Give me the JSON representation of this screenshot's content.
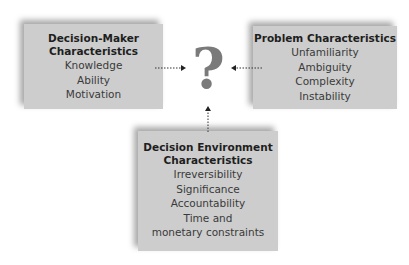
{
  "diagram": {
    "center_symbol": "?",
    "boxes": {
      "decision_maker": {
        "title_lines": [
          "Decision-Maker",
          "Characteristics"
        ],
        "items": [
          "Knowledge",
          "Ability",
          "Motivation"
        ]
      },
      "problem": {
        "title_lines": [
          "Problem Characteristics"
        ],
        "items": [
          "Unfamiliarity",
          "Ambiguity",
          "Complexity",
          "Instability"
        ]
      },
      "decision_environment": {
        "title_lines": [
          "Decision Environment",
          "Characteristics"
        ],
        "items": [
          "Irreversibility",
          "Significance",
          "Accountability",
          "Time and",
          "monetary constraints"
        ]
      }
    },
    "colors": {
      "box_fill": "#cdcdcd",
      "question_mark": "#7a7a7a",
      "arrow": "#333333"
    }
  }
}
